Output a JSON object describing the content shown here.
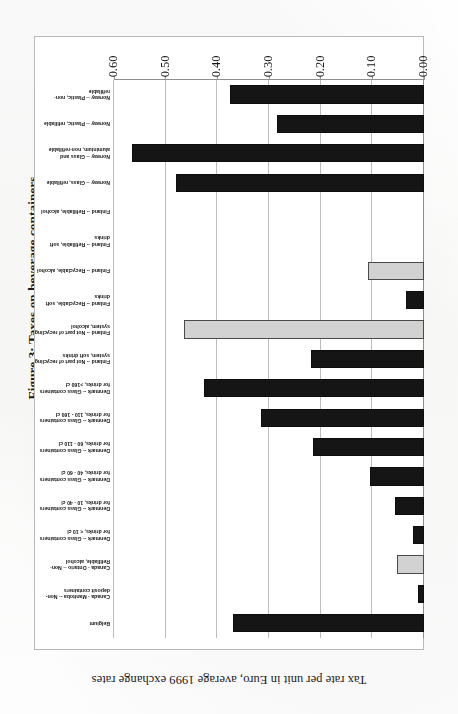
{
  "figure": {
    "title": "Figure 3: Taxes on beverage containers",
    "axis_title": "Tax rate per unit in Euro, average 1999 exchange rates"
  },
  "colors": {
    "bar_dark": "#151515",
    "bar_light": "#d2d2d2",
    "gridline": "#bdbdbd",
    "frame": "#b9b9b9",
    "background": "#ffffff"
  },
  "chart_data": {
    "type": "bar",
    "orientation": "horizontal",
    "title": "Figure 3: Taxes on beverage containers",
    "xlabel": "Tax rate per unit in Euro, average 1999 exchange rates",
    "ylabel": "",
    "xlim": [
      0.0,
      0.6
    ],
    "grid": true,
    "legend": "none",
    "tick_labels": [
      "0.00",
      "0.10",
      "0.20",
      "0.30",
      "0.40",
      "0.50",
      "0.60"
    ],
    "tick_values": [
      0.0,
      0.1,
      0.2,
      0.3,
      0.4,
      0.5,
      0.6
    ],
    "categories": [
      "Belgium",
      "Canada - Manitoba -- Non-deposit containers",
      "Canada - Ontario -- Non-Refillable, alcohol",
      "Denmark -- Glass containers for drinks, < 10 cl",
      "Denmark -- Glass containers for drinks, 10 - 40 cl",
      "Denmark -- Glass containers for drinks, 40 - 60 cl",
      "Denmark -- Glass containers for drinks, 60 - 110 cl",
      "Denmark -- Glass containers for drinks, 110 - 160 cl",
      "Denmark -- Glass containers for drinks, >160 cl",
      "Finland -- Not part of recycling system, soft drinks",
      "Finland -- Not part of recycling system, alcohol",
      "Finland -- Recyclable, soft drinks",
      "Finland -- Recyclable, alcohol",
      "Finland -- Refillable, soft drinks",
      "Finland -- Refillable, alcohol",
      "Norway -- Glass, refillable",
      "Norway -- Glass and aluminium, non-refillable",
      "Norway -- Plastic, refillable",
      "Norway -- Plastic, non-refillable"
    ],
    "values": [
      0.37,
      0.012,
      0.052,
      0.021,
      0.057,
      0.105,
      0.215,
      0.315,
      0.425,
      0.218,
      0.465,
      0.035,
      0.108,
      0.0,
      0.0,
      0.48,
      0.565,
      0.285,
      0.375
    ],
    "shades": [
      "dark",
      "dark",
      "light",
      "dark",
      "dark",
      "dark",
      "dark",
      "dark",
      "dark",
      "dark",
      "light",
      "dark",
      "light",
      "none",
      "none",
      "dark",
      "dark",
      "dark",
      "dark"
    ]
  }
}
